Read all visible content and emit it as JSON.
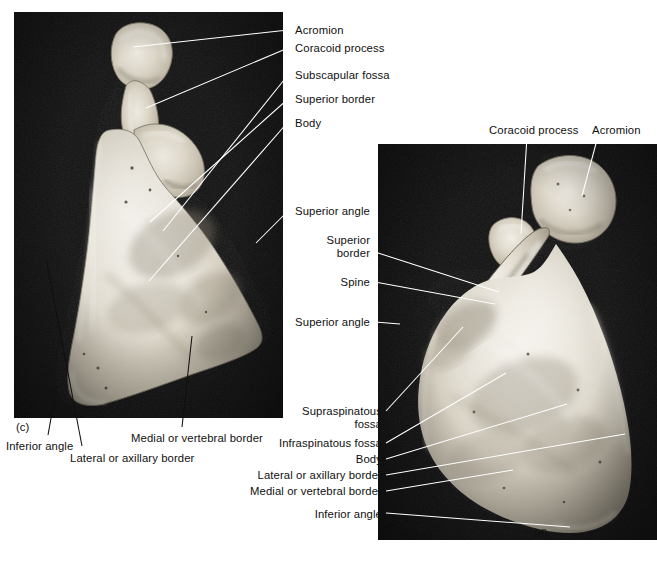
{
  "figure": {
    "background_color": "#ffffff",
    "label_color": "#101010",
    "leader_line_color_on_black": "#ffffff",
    "leader_line_color_on_bone": "#101010",
    "photo_backdrop_color": "#141414",
    "bone_color": "#d8d2c6"
  },
  "panels": [
    {
      "id": "c",
      "id_label": "(c)",
      "view": "anterior-costal-surface",
      "photo": {
        "x": 14,
        "y": 12,
        "w": 269,
        "h": 406
      },
      "id_position": {
        "x": 16,
        "y": 421
      }
    },
    {
      "id": "d",
      "id_label": "(d)",
      "view": "posterior-dorsal-surface",
      "photo": {
        "x": 378,
        "y": 144,
        "w": 279,
        "h": 396
      },
      "id_position": {
        "x": 534,
        "y": 527
      }
    }
  ],
  "labels": [
    {
      "key": "c-acromion",
      "text": "Acromion",
      "panel": "c",
      "align": "left",
      "text_x": 295,
      "text_y": 24,
      "leader": {
        "x1": 288,
        "y1": 30,
        "x2": 133,
        "y2": 47,
        "color": "#ffffff"
      }
    },
    {
      "key": "c-coracoid-process",
      "text": "Coracoid process",
      "panel": "c",
      "align": "left",
      "text_x": 295,
      "text_y": 42,
      "leader": {
        "x1": 288,
        "y1": 48,
        "x2": 146,
        "y2": 108,
        "color": "#ffffff"
      }
    },
    {
      "key": "c-subscapular-fossa",
      "text": "Subscapular fossa",
      "panel": "c",
      "align": "left",
      "text_x": 295,
      "text_y": 69,
      "leader": {
        "x1": 288,
        "y1": 75,
        "x2": 163,
        "y2": 231,
        "color": "#ffffff"
      }
    },
    {
      "key": "c-superior-border",
      "text": "Superior border",
      "panel": "c",
      "align": "left",
      "text_x": 295,
      "text_y": 93,
      "leader": {
        "x1": 288,
        "y1": 99,
        "x2": 150,
        "y2": 222,
        "color": "#ffffff"
      }
    },
    {
      "key": "c-body",
      "text": "Body",
      "panel": "c",
      "align": "left",
      "text_x": 295,
      "text_y": 117,
      "leader": {
        "x1": 288,
        "y1": 122,
        "x2": 149,
        "y2": 281,
        "color": "#ffffff"
      }
    },
    {
      "key": "c-superior-angle",
      "text": "Superior angle",
      "panel": "c",
      "align": "left",
      "text_x": 295,
      "text_y": 205,
      "leader": {
        "x1": 288,
        "y1": 211,
        "x2": 256,
        "y2": 243,
        "color": "#ffffff"
      }
    },
    {
      "key": "c-inferior-angle",
      "text": "Inferior angle",
      "panel": "c",
      "align": "left",
      "text_x": 6,
      "text_y": 440,
      "leader": {
        "x1": 48,
        "y1": 435,
        "x2": 57,
        "y2": 385,
        "color": "#101010"
      }
    },
    {
      "key": "c-lateral-or-axillary-border",
      "text": "Lateral or axillary border",
      "panel": "c",
      "align": "left",
      "text_x": 70,
      "text_y": 452,
      "leader": {
        "x1": 82,
        "y1": 446,
        "x2": 46,
        "y2": 258,
        "color": "#101010"
      }
    },
    {
      "key": "c-medial-or-vertebral-border",
      "text": "Medial or vertebral border",
      "panel": "c",
      "align": "left",
      "text_x": 131,
      "text_y": 432,
      "leader": {
        "x1": 182,
        "y1": 427,
        "x2": 192,
        "y2": 336,
        "color": "#101010"
      }
    },
    {
      "key": "d-coracoid-process",
      "text": "Coracoid process",
      "panel": "d",
      "align": "left",
      "text_x": 489,
      "text_y": 124,
      "leader": {
        "x1": 527,
        "y1": 136,
        "x2": 521,
        "y2": 234,
        "color": "#ffffff"
      }
    },
    {
      "key": "d-acromion",
      "text": "Acromion",
      "panel": "d",
      "align": "left",
      "text_x": 592,
      "text_y": 124,
      "leader": {
        "x1": 598,
        "y1": 136,
        "x2": 582,
        "y2": 196,
        "color": "#ffffff"
      }
    },
    {
      "key": "d-superior-border",
      "text": "Superior\nborder",
      "panel": "d",
      "align": "right",
      "text_x": 370,
      "text_y": 234,
      "leader": {
        "x1": 375,
        "y1": 252,
        "x2": 499,
        "y2": 292,
        "color": "#ffffff"
      }
    },
    {
      "key": "d-spine",
      "text": "Spine",
      "panel": "d",
      "align": "right",
      "text_x": 370,
      "text_y": 276,
      "leader": {
        "x1": 375,
        "y1": 282,
        "x2": 495,
        "y2": 304,
        "color": "#ffffff"
      }
    },
    {
      "key": "d-superior-angle",
      "text": "Superior angle",
      "panel": "d",
      "align": "right",
      "text_x": 370,
      "text_y": 316,
      "leader": {
        "x1": 375,
        "y1": 322,
        "x2": 400,
        "y2": 324,
        "color": "#ffffff"
      }
    },
    {
      "key": "d-supraspinatous-fossa",
      "text": "Supraspinatous\nfossa",
      "panel": "d",
      "align": "right",
      "text_x": 382,
      "text_y": 405,
      "leader": {
        "x1": 386,
        "y1": 411,
        "x2": 463,
        "y2": 327,
        "color": "#ffffff"
      }
    },
    {
      "key": "d-infraspinatous-fossa",
      "text": "Infraspinatous fossa",
      "panel": "d",
      "align": "right",
      "text_x": 382,
      "text_y": 437,
      "leader": {
        "x1": 386,
        "y1": 443,
        "x2": 506,
        "y2": 373,
        "color": "#ffffff"
      }
    },
    {
      "key": "d-body",
      "text": "Body",
      "panel": "d",
      "align": "right",
      "text_x": 382,
      "text_y": 453,
      "leader": {
        "x1": 386,
        "y1": 459,
        "x2": 567,
        "y2": 404,
        "color": "#ffffff"
      }
    },
    {
      "key": "d-lateral-or-axillary-border",
      "text": "Lateral or axillary border",
      "panel": "d",
      "align": "right",
      "text_x": 382,
      "text_y": 469,
      "leader": {
        "x1": 386,
        "y1": 475,
        "x2": 625,
        "y2": 434,
        "color": "#ffffff"
      }
    },
    {
      "key": "d-medial-or-vertebral-border",
      "text": "Medial or vertebral border",
      "panel": "d",
      "align": "right",
      "text_x": 382,
      "text_y": 485,
      "leader": {
        "x1": 386,
        "y1": 491,
        "x2": 513,
        "y2": 470,
        "color": "#ffffff"
      }
    },
    {
      "key": "d-inferior-angle",
      "text": "Inferior angle",
      "panel": "d",
      "align": "right",
      "text_x": 382,
      "text_y": 508,
      "leader": {
        "x1": 386,
        "y1": 513,
        "x2": 570,
        "y2": 527,
        "color": "#ffffff"
      }
    }
  ]
}
